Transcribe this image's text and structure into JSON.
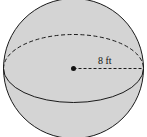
{
  "diagram": {
    "shape": "sphere",
    "radius_label": "8 ft",
    "radius_value": 8,
    "unit": "ft",
    "colors": {
      "fill": "#d4d4d4",
      "stroke": "#1a1a1a",
      "background": "#ffffff"
    }
  }
}
